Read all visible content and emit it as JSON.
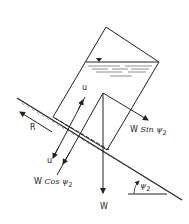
{
  "diagram": {
    "type": "free-body force diagram of water-filled block on inclined plane",
    "labels": {
      "u_top": "u",
      "u_bottom": "u",
      "R": "R",
      "w_sin_prefix": "W",
      "w_sin_fn": "Sin",
      "w_sin_angle": "ψ",
      "w_sin_sub": "2",
      "w_cos_prefix": "W",
      "w_cos_fn": "Cos",
      "w_cos_angle": "ψ",
      "w_cos_sub": "2",
      "W": "W",
      "angle": "ψ",
      "angle_sub": "2"
    },
    "colors": {
      "line": "#222222",
      "background": "#ffffff"
    }
  }
}
